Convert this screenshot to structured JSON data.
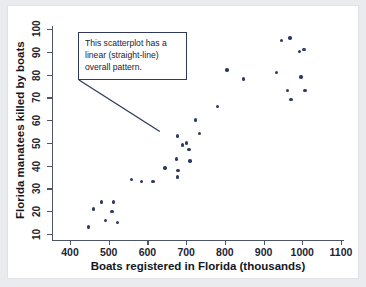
{
  "annotation": {
    "text": "This scatterplot has a linear (straight-line) overall pattern.",
    "border_color": "#2e3a5c"
  },
  "colors": {
    "point": "#2f3a63",
    "axis": "#4c5668",
    "text": "#111726",
    "page_background": "#e9ebef",
    "figure_background": "#ffffff"
  },
  "chart_data": {
    "type": "scatter",
    "title": "",
    "xlabel": "Boats registered in Florida (thousands)",
    "ylabel": "Florida manatees killed by boats",
    "xlim": [
      370,
      1120
    ],
    "ylim": [
      7,
      101
    ],
    "xticks": [
      400,
      500,
      600,
      700,
      800,
      900,
      1000,
      1100
    ],
    "yticks": [
      10,
      20,
      30,
      40,
      50,
      60,
      70,
      80,
      90,
      100
    ],
    "grid": false,
    "legend": null,
    "annotations": [
      {
        "text": "This scatterplot has a linear (straight-line) overall pattern.",
        "points_to": [
          632,
          55
        ]
      }
    ],
    "points": [
      [
        447,
        13
      ],
      [
        460,
        21
      ],
      [
        481,
        24
      ],
      [
        492,
        16
      ],
      [
        508,
        20
      ],
      [
        512,
        24
      ],
      [
        523,
        15
      ],
      [
        559,
        34
      ],
      [
        585,
        33
      ],
      [
        614,
        33
      ],
      [
        645,
        39
      ],
      [
        675,
        43
      ],
      [
        678,
        53
      ],
      [
        679,
        38
      ],
      [
        678,
        35
      ],
      [
        690,
        49
      ],
      [
        701,
        50
      ],
      [
        707,
        47
      ],
      [
        710,
        42
      ],
      [
        724,
        60
      ],
      [
        735,
        54
      ],
      [
        781,
        66
      ],
      [
        806,
        82
      ],
      [
        848,
        78
      ],
      [
        934,
        81
      ],
      [
        946,
        95
      ],
      [
        962,
        73
      ],
      [
        968,
        96
      ],
      [
        971,
        69
      ],
      [
        992,
        90
      ],
      [
        997,
        79
      ],
      [
        1004,
        91
      ],
      [
        1007,
        73
      ]
    ]
  }
}
